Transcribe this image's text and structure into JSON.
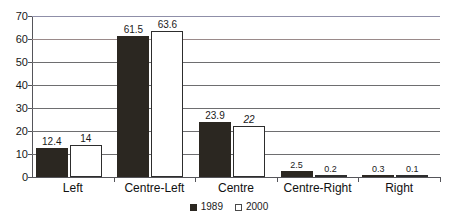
{
  "chart_data": {
    "type": "bar",
    "title": "",
    "subtitle": "",
    "xlabel": "",
    "ylabel": "",
    "ylim": [
      0,
      70
    ],
    "ytick_step": 10,
    "yticks": [
      0,
      10,
      20,
      30,
      40,
      50,
      60,
      70
    ],
    "grid": true,
    "grid_axis": "y",
    "legend_position": "bottom-center",
    "categories": [
      "Left",
      "Centre-Left",
      "Centre",
      "Centre-Right",
      "Right"
    ],
    "series": [
      {
        "name": "1989",
        "color": "#2b2721",
        "style": "filled",
        "values": [
          12.4,
          61.5,
          23.9,
          2.5,
          0.3
        ],
        "labels": [
          "12.4",
          "61.5",
          "23.9",
          "2.5",
          "0.3"
        ]
      },
      {
        "name": "2000",
        "color": "#ffffff",
        "style": "hollow",
        "values": [
          14,
          63.6,
          22,
          0.2,
          0.1
        ],
        "labels": [
          "14",
          "63.6",
          "22",
          "0.2",
          "0.1"
        ]
      }
    ]
  },
  "axis": {
    "y_tick_labels": [
      "70",
      "60",
      "50",
      "40",
      "30",
      "20",
      "10",
      "0"
    ]
  },
  "legend": {
    "items": [
      {
        "label": "1989",
        "swatch": "filled-square-icon"
      },
      {
        "label": "2000",
        "swatch": "hollow-square-icon"
      }
    ]
  },
  "colors": {
    "series_1989": "#2b2721",
    "series_2000": "#ffffff",
    "gridline": "#6e6e70",
    "gridline_top": "#8f8fa8",
    "gridline_60": "#9a8a8a",
    "axis": "#55555a",
    "text": "#1a1a1a",
    "background": "#ffffff"
  }
}
